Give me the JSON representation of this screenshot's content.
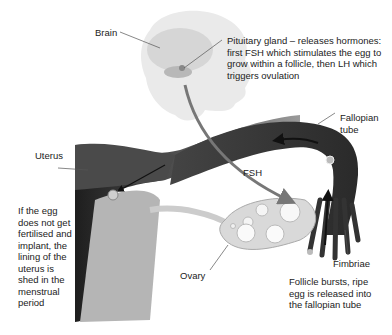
{
  "labels": {
    "brain": "Brain",
    "pituitary": [
      "Pituitary gland – releases hormones:",
      "first FSH which stimulates the egg to",
      "grow within a follicle, then LH which",
      "triggers ovulation"
    ],
    "fallopian_tube": [
      "Fallopian",
      "tube"
    ],
    "uterus": "Uterus",
    "fsh": "FSH",
    "menstruation": [
      "If the egg",
      "does not get",
      "fertilised and",
      "implant, the",
      "lining of the",
      "uterus is",
      "shed in the",
      "menstrual",
      "period"
    ],
    "ovary": "Ovary",
    "fimbriae": "Fimbriae",
    "ovulation": [
      "Follicle bursts, ripe",
      "egg is released into",
      "the fallopian tube"
    ]
  },
  "colors": {
    "head": "#e8e8e8",
    "brain": "#d2d2d2",
    "tube_dark": "#3a3a3a",
    "tube_mid": "#6e6e6e",
    "uterus_light": "#bdbdbd",
    "ovary": "#d9d9d9",
    "arrow": "#777777",
    "leader": "#555555"
  }
}
